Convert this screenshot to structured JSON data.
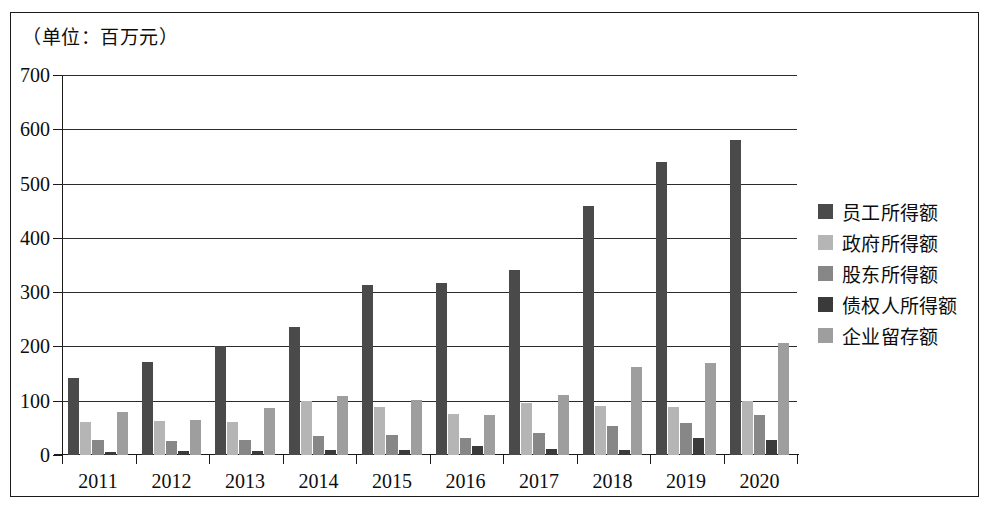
{
  "caption": "（单位：百万元）",
  "chart_data": {
    "type": "bar",
    "title": "",
    "subtitle": "",
    "caption": "（单位：百万元）",
    "xlabel": "",
    "ylabel": "",
    "unit": "百万元",
    "ylim": [
      0,
      700
    ],
    "ytick_step": 100,
    "yticks": [
      0,
      100,
      200,
      300,
      400,
      500,
      600,
      700
    ],
    "ytick_labels": [
      "0",
      "100",
      "200",
      "300",
      "400",
      "500",
      "600",
      "700"
    ],
    "grid": "horizontal",
    "legend_position": "right",
    "categories": [
      "2011",
      "2012",
      "2013",
      "2014",
      "2015",
      "2016",
      "2017",
      "2018",
      "2019",
      "2020"
    ],
    "series": [
      {
        "name": "员工所得额",
        "color": "#4a4a4a",
        "values": [
          142,
          172,
          200,
          236,
          313,
          316,
          341,
          459,
          539,
          580
        ]
      },
      {
        "name": "政府所得额",
        "color": "#b5b5b5",
        "values": [
          60,
          63,
          61,
          100,
          88,
          76,
          95,
          91,
          89,
          99
        ]
      },
      {
        "name": "股东所得额",
        "color": "#878787",
        "values": [
          28,
          25,
          27,
          35,
          36,
          31,
          41,
          54,
          59,
          73
        ]
      },
      {
        "name": "债权人所得额",
        "color": "#3a3a3a",
        "values": [
          5,
          8,
          7,
          10,
          10,
          16,
          12,
          9,
          31,
          28
        ]
      },
      {
        "name": "企业留存额",
        "color": "#9e9e9e",
        "values": [
          80,
          65,
          86,
          109,
          102,
          74,
          110,
          162,
          170,
          207
        ]
      }
    ]
  }
}
